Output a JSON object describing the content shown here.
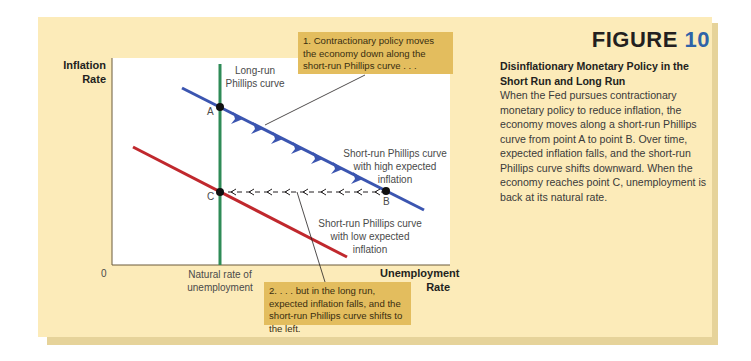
{
  "figure": {
    "label": "FIGURE",
    "number": "10",
    "caption_title": "Disinflationary Monetary Policy in the Short Run and Long Run",
    "caption_body": "When the Fed pursues contractionary monetary policy to reduce inflation, the economy moves along a short-run Phillips curve from point A to point B. Over time, expected inflation falls, and the short-run Phillips curve shifts downward. When the economy reaches point C, unemployment is back at its natural rate."
  },
  "axes": {
    "y_label_line1": "Inflation",
    "y_label_line2": "Rate",
    "x_label_line1": "Unemployment",
    "x_label_line2": "Rate",
    "origin": "0",
    "natural_rate_line1": "Natural rate of",
    "natural_rate_line2": "unemployment"
  },
  "curves": {
    "long_run_line1": "Long-run",
    "long_run_line2": "Phillips curve",
    "high_line1": "Short-run Phillips curve",
    "high_line2": "with high expected",
    "high_line3": "inflation",
    "low_line1": "Short-run Phillips curve",
    "low_line2": "with low expected",
    "low_line3": "inflation"
  },
  "points": {
    "a": "A",
    "b": "B",
    "c": "C"
  },
  "callouts": {
    "one": "1. Contractionary policy moves the economy down along the short-run Phillips curve . . .",
    "two": "2. . . . but in the long run, expected inflation falls, and the short-run Phillips curve shifts to the left."
  },
  "colors": {
    "panel": "#fcebb9",
    "callout": "#e3bd5e",
    "long_run": "#2e8b57",
    "sr_high": "#3b55b0",
    "sr_low": "#c0282d",
    "figure_number": "#2e63a8"
  }
}
